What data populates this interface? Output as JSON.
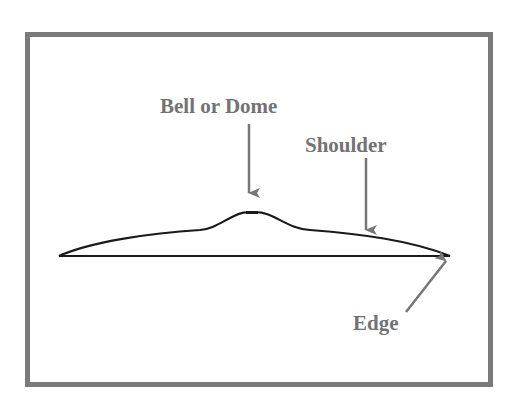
{
  "diagram": {
    "type": "cross-section profile",
    "labels": {
      "bell": "Bell or Dome",
      "shoulder": "Shoulder",
      "edge": "Edge"
    },
    "colors": {
      "frame": "#7a7a7a",
      "label": "#737373",
      "arrow": "#777777",
      "profile": "#1a1a1a",
      "background": "#ffffff"
    }
  }
}
